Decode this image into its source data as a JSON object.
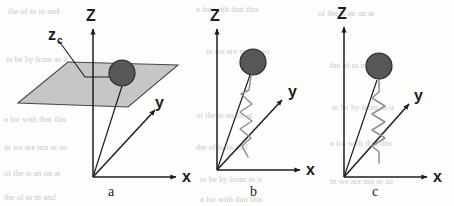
{
  "figure": {
    "background_color": "#fdfdfc",
    "ink_color": "#1d1d1d",
    "plane_fill_color": "#c6c6c4",
    "plane_stroke_color": "#4a4a4a",
    "sphere_fill_color": "#575757",
    "sphere_stroke_color": "#2b2b2b",
    "spring_color": "#8f8f8f"
  },
  "panels": [
    {
      "id": "a",
      "caption": "a",
      "axes": {
        "z_label": "Z",
        "y_label": "y",
        "x_label": "x"
      },
      "annotation_label": "z",
      "annotation_subscript": "c",
      "has_plane": true,
      "has_sphere": true,
      "has_spring": false
    },
    {
      "id": "b",
      "caption": "b",
      "axes": {
        "z_label": "Z",
        "y_label": "y",
        "x_label": "x"
      },
      "has_plane": false,
      "has_sphere": true,
      "has_spring": true,
      "spring_orientation": "diagonal"
    },
    {
      "id": "c",
      "caption": "c",
      "axes": {
        "z_label": "Z",
        "y_label": "y",
        "x_label": "x"
      },
      "has_plane": false,
      "has_sphere": true,
      "has_spring": true,
      "spring_orientation": "vertical"
    }
  ],
  "background_artifacts": {
    "note": "faint illegible scanned-page bleed-through text",
    "lines": [
      "the     of    to   in    and",
      "a    for   with   that   this",
      "of   the   is   an   on   at",
      "to   be   by   from   as   it",
      "in   we   are   not   or   so"
    ]
  }
}
